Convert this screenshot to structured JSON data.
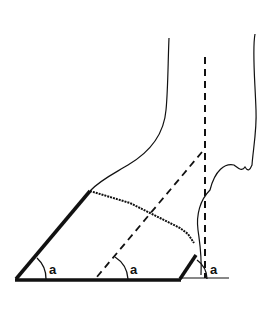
{
  "diagram": {
    "angle_labels": [
      {
        "text": "a",
        "position": "toe"
      },
      {
        "text": "a",
        "position": "pastern-axis"
      },
      {
        "text": "a",
        "position": "heel"
      }
    ],
    "colors": {
      "ink": "#111111",
      "background": "#ffffff"
    }
  }
}
